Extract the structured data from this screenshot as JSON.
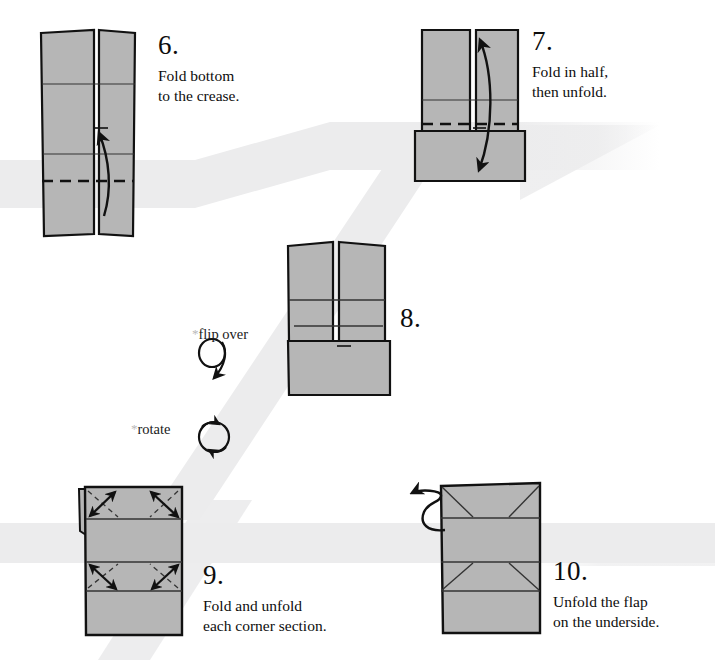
{
  "page": {
    "background_color": "#ffffff",
    "band_color": "#ececed",
    "paper_fill": "#b6b6b6",
    "paper_fill_shadow": "#a9a9a9",
    "ink_color": "#111111"
  },
  "steps": [
    {
      "number": "6.",
      "text": "Fold bottom\nto the crease.",
      "num_x": 158,
      "num_y": 32,
      "text_x": 158,
      "text_y": 62
    },
    {
      "number": "7.",
      "text": "Fold in half,\nthen unfold.",
      "num_x": 532,
      "num_y": 28,
      "text_x": 532,
      "text_y": 58
    },
    {
      "number": "8.",
      "text": "",
      "num_x": 400,
      "num_y": 305,
      "text_x": 400,
      "text_y": 335
    },
    {
      "number": "9.",
      "text": "Fold and unfold\neach corner section.",
      "num_x": 203,
      "num_y": 562,
      "text_x": 203,
      "text_y": 594
    },
    {
      "number": "10.",
      "text": "Unfold the flap\non the underside.",
      "num_x": 553,
      "num_y": 558,
      "text_x": 553,
      "text_y": 590
    }
  ],
  "symbols": [
    {
      "name": "flip-over",
      "star": "*",
      "label": "flip over",
      "label_x": 192,
      "label_y": 326
    },
    {
      "name": "rotate",
      "star": "*",
      "label": "rotate",
      "label_x": 131,
      "label_y": 421
    }
  ]
}
